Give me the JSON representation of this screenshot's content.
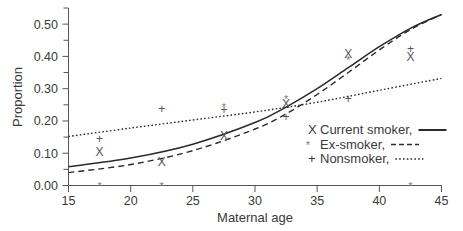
{
  "chart_data": {
    "type": "scatter",
    "title": "",
    "xlabel": "Maternal age",
    "ylabel": "Proportion",
    "xlim": [
      15,
      45
    ],
    "ylim": [
      0.0,
      0.55
    ],
    "xticks": [
      15,
      20,
      25,
      30,
      35,
      40,
      45
    ],
    "xtick_labels": [
      "15",
      "20",
      "25",
      "30",
      "35",
      "40",
      "45"
    ],
    "yticks": [
      0.0,
      0.1,
      0.2,
      0.3,
      0.4,
      0.5
    ],
    "ytick_labels": [
      "0.00",
      "0.10",
      "0.20",
      "0.30",
      "0.40",
      "0.50"
    ],
    "yminor_ticks": [
      0.05,
      0.15,
      0.25,
      0.35,
      0.45,
      0.55
    ],
    "grid": false,
    "legend_position": "lower-right",
    "x": [
      17.5,
      22.5,
      27.5,
      32.5,
      37.5,
      42.5
    ],
    "series": [
      {
        "name": "Current smoker",
        "marker": "X",
        "linestyle": "solid",
        "values": [
          0.105,
          0.075,
          0.155,
          0.255,
          0.41,
          0.4
        ],
        "fit": [
          [
            15,
            0.058
          ],
          [
            20,
            0.085
          ],
          [
            25,
            0.128
          ],
          [
            30,
            0.195
          ],
          [
            32.5,
            0.243
          ],
          [
            35,
            0.3
          ],
          [
            37.5,
            0.365
          ],
          [
            40,
            0.43
          ],
          [
            42.5,
            0.487
          ],
          [
            45,
            0.53
          ]
        ]
      },
      {
        "name": "Ex-smoker",
        "marker": "*",
        "linestyle": "dashed",
        "values": [
          0.0,
          0.0,
          0.245,
          0.27,
          0.39,
          0.0
        ],
        "fit": [
          [
            15,
            0.04
          ],
          [
            20,
            0.065
          ],
          [
            25,
            0.108
          ],
          [
            30,
            0.175
          ],
          [
            32.5,
            0.222
          ],
          [
            35,
            0.282
          ],
          [
            37.5,
            0.35
          ],
          [
            40,
            0.42
          ],
          [
            42.5,
            0.483
          ],
          [
            45,
            0.53
          ]
        ]
      },
      {
        "name": "Nonsmoker",
        "marker": "+",
        "linestyle": "dotted",
        "values": [
          0.145,
          0.24,
          0.235,
          0.215,
          0.27,
          0.425
        ],
        "fit": [
          [
            15,
            0.152
          ],
          [
            20,
            0.178
          ],
          [
            25,
            0.203
          ],
          [
            30,
            0.228
          ],
          [
            35,
            0.258
          ],
          [
            40,
            0.295
          ],
          [
            45,
            0.332
          ]
        ]
      }
    ],
    "legend": [
      {
        "marker": "X",
        "label": "Current smoker,",
        "linestyle": "solid"
      },
      {
        "marker": "*",
        "label": "Ex-smoker,",
        "linestyle": "dashed"
      },
      {
        "marker": "+",
        "label": "Nonsmoker,",
        "linestyle": "dotted"
      }
    ]
  },
  "colors": {
    "axis": "#555555",
    "curve": "#2a2a2a",
    "marker": "#555555",
    "background": "#ffffff"
  }
}
